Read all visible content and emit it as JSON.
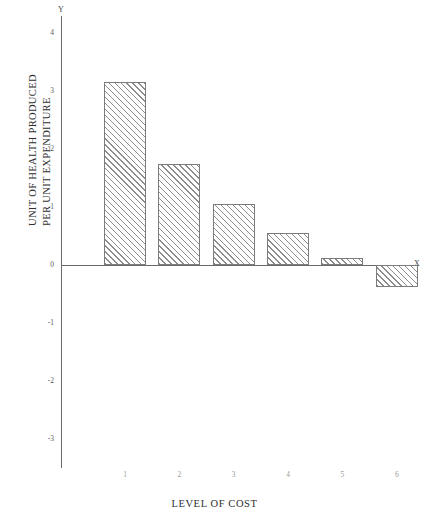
{
  "chart_data": {
    "type": "bar",
    "title": "",
    "subtitle": "",
    "xlabel": "LEVEL OF COST",
    "ylabel_line1": "UNIT OF  HEALTH PRODUCED",
    "ylabel_line2": "PER UNIT EXPENDITURE",
    "x_axis_letter": "X",
    "y_axis_letter": "Y",
    "categories": [
      "1",
      "2",
      "3",
      "4",
      "5",
      "6"
    ],
    "values": [
      3.15,
      1.75,
      1.05,
      0.55,
      0.12,
      -0.38
    ],
    "ytick_labels": [
      "4",
      "3",
      "2",
      "1",
      "0",
      "-1",
      "-2",
      "-3"
    ],
    "ytick_values": [
      4,
      3,
      2,
      1,
      0,
      -1,
      -2,
      -3
    ],
    "ylim": [
      -3.5,
      4.3
    ],
    "xlim": [
      0.4,
      6.6
    ],
    "grid": false,
    "legend": null,
    "bar_fill": "hatch-45-forward",
    "bar_edge_color": "#7c7c7c",
    "axis_color": "#6a6a6a",
    "background_color": "#ffffff"
  }
}
